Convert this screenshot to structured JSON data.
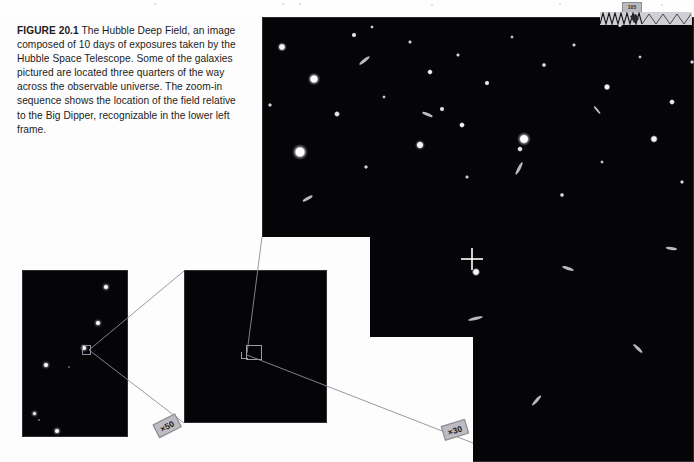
{
  "figure": {
    "label": "FIGURE 20.1",
    "caption": "The Hubble Deep Field, an image composed of 10 days of exposures taken by the Hubble Space Telescope. Some of the galaxies pictured are located three quarters of the way across the observable universe. The zoom-in sequence shows the location of the field relative to the Big Dipper, recognizable in the lower left frame."
  },
  "panels": {
    "main": {
      "name": "Hubble Deep Field image",
      "background_color": "#050507"
    },
    "middle": {
      "name": "Intermediate star field zoom panel",
      "background_color": "#050508"
    },
    "dipper": {
      "name": "Big Dipper wide field panel",
      "background_color": "#050507",
      "stars": [
        {
          "x": 84,
          "y": 17,
          "r": 2.2
        },
        {
          "x": 76,
          "y": 53,
          "r": 2.0
        },
        {
          "x": 62,
          "y": 78,
          "r": 2.2
        },
        {
          "x": 24,
          "y": 95,
          "r": 1.9
        },
        {
          "x": 12,
          "y": 143,
          "r": 1.5
        },
        {
          "x": 35,
          "y": 161,
          "r": 2.2
        },
        {
          "x": 47,
          "y": 97,
          "r": 1.0
        }
      ]
    }
  },
  "magnification": {
    "dipper_to_middle": "×50",
    "middle_to_main": "×30"
  },
  "artifact": {
    "tag_text": "105"
  },
  "colors": {
    "page_background": "#fdfdfd",
    "image_background": "#050507",
    "caption_text": "#1c1c1c",
    "label_fill": "#bcbcc2",
    "leader_line": "#8e8e96"
  }
}
